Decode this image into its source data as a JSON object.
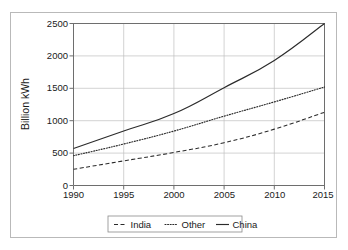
{
  "chart_data": {
    "type": "line",
    "title": "",
    "xlabel": "",
    "ylabel": "Billion kWh",
    "xlim": [
      1990,
      2015
    ],
    "ylim": [
      0,
      2500
    ],
    "grid": true,
    "legend_position": "bottom",
    "x": [
      1990,
      1995,
      2000,
      2005,
      2010,
      2015
    ],
    "xticklabels": [
      "1990",
      "1995",
      "2000",
      "2005",
      "2010",
      "2015"
    ],
    "yticks": [
      0,
      500,
      1000,
      1500,
      2000,
      2500
    ],
    "yticklabels": [
      "0",
      "500",
      "1000",
      "1500",
      "2000",
      "2500"
    ],
    "series": [
      {
        "name": "India",
        "style": "dashed",
        "color": "#2b2b2b",
        "x": [
          1990,
          1995,
          2000,
          2005,
          2010,
          2015
        ],
        "values": [
          250,
          380,
          510,
          660,
          870,
          1130
        ]
      },
      {
        "name": "Other",
        "style": "dotted",
        "color": "#2b2b2b",
        "x": [
          1990,
          1995,
          2000,
          2005,
          2010,
          2015
        ],
        "values": [
          460,
          640,
          840,
          1070,
          1290,
          1520
        ]
      },
      {
        "name": "China",
        "style": "solid",
        "color": "#2b2b2b",
        "x": [
          1990,
          1995,
          2000,
          2005,
          2010,
          2015
        ],
        "values": [
          570,
          840,
          1110,
          1510,
          1930,
          2500
        ]
      }
    ]
  },
  "axes": {
    "y_title": "Billion kWh",
    "y_tick_0": "0",
    "y_tick_1": "500",
    "y_tick_2": "1000",
    "y_tick_3": "1500",
    "y_tick_4": "2000",
    "y_tick_5": "2500",
    "x_tick_0": "1990",
    "x_tick_1": "1995",
    "x_tick_2": "2000",
    "x_tick_3": "2005",
    "x_tick_4": "2010",
    "x_tick_5": "2015"
  },
  "legend": {
    "entries": [
      {
        "label": "India",
        "style": "dashed"
      },
      {
        "label": "Other",
        "style": "dotted"
      },
      {
        "label": "China",
        "style": "solid"
      }
    ]
  },
  "colors": {
    "ink": "#2b2b2b",
    "grid": "#c0c0c0",
    "frame": "#b9b9b9",
    "axis": "#6e6e6e"
  }
}
